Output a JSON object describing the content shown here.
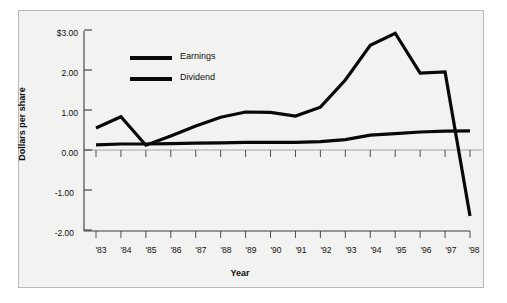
{
  "chart_data": {
    "type": "line",
    "title": "",
    "subtitle": "",
    "xlabel": "Year",
    "ylabel": "Dollars per share",
    "categories": [
      "'83",
      "'84",
      "'85",
      "'86",
      "'87",
      "'88",
      "'89",
      "'90",
      "'91",
      "'92",
      "'93",
      "'94",
      "'95",
      "'96",
      "'97",
      "'98"
    ],
    "x": [
      1983,
      1984,
      1985,
      1986,
      1987,
      1988,
      1989,
      1990,
      1991,
      1992,
      1993,
      1994,
      1995,
      1996,
      1997,
      1998
    ],
    "ylim": [
      -2.0,
      3.0
    ],
    "yticks": [
      3.0,
      2.0,
      1.0,
      0.0,
      -1.0,
      -2.0
    ],
    "ytick_labels": [
      "$3.00",
      "2.00",
      "1.00",
      "0.00",
      "-1.00",
      "-2.00"
    ],
    "grid": false,
    "legend_position": "upper-left-inside",
    "series": [
      {
        "name": "Earnings",
        "color": "#080808",
        "values": [
          0.55,
          0.83,
          0.12,
          0.35,
          0.6,
          0.82,
          0.95,
          0.94,
          0.85,
          1.07,
          1.75,
          2.62,
          2.92,
          1.92,
          1.95,
          -1.65
        ]
      },
      {
        "name": "Dividend",
        "color": "#080808",
        "values": [
          0.13,
          0.15,
          0.15,
          0.16,
          0.17,
          0.18,
          0.19,
          0.19,
          0.19,
          0.21,
          0.26,
          0.37,
          0.41,
          0.45,
          0.47,
          0.48
        ]
      }
    ],
    "annotations": []
  },
  "legend": {
    "items": [
      {
        "label": "Earnings"
      },
      {
        "label": "Dividend"
      }
    ]
  },
  "axes": {
    "y_label": "Dollars per share",
    "x_label": "Year",
    "y_ticks": [
      "$3.00",
      "2.00",
      "1.00",
      "0.00",
      "-1.00",
      "-2.00"
    ],
    "x_ticks": [
      "'83",
      "'84",
      "'85",
      "'86",
      "'87",
      "'88",
      "'89",
      "'90",
      "'91",
      "'92",
      "'93",
      "'94",
      "'95",
      "'96",
      "'97",
      "'98"
    ]
  },
  "colors": {
    "panel_background": "#f2f2f0",
    "panel_border": "#b9b9b5",
    "axis": "#3a3a3a",
    "series": "#080808",
    "text": "#111111"
  }
}
